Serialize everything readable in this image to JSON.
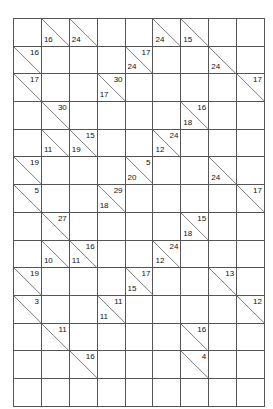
{
  "puzzle": {
    "type": "kakuro-grid",
    "rows": 14,
    "cols": 9,
    "colors": {
      "block": "#8a8a8a",
      "clue": "#e4e4e4",
      "blank": "#ffffff",
      "border": "#555555",
      "text": "#111111"
    },
    "legend": {
      "block": "solid dark grey cell, no clue",
      "clue": "light grey cell split by a diagonal; upper-right number is the across sum, lower-left number is the down sum",
      "blank": "empty white cell to be filled by the solver"
    },
    "cells": [
      [
        {
          "kind": "block"
        },
        {
          "kind": "clue",
          "down": "16"
        },
        {
          "kind": "clue",
          "down": "24"
        },
        {
          "kind": "block"
        },
        {
          "kind": "block"
        },
        {
          "kind": "clue",
          "down": "24"
        },
        {
          "kind": "clue",
          "down": "15"
        },
        {
          "kind": "block"
        },
        {
          "kind": "block"
        }
      ],
      [
        {
          "kind": "clue",
          "across": "16"
        },
        {
          "kind": "blank"
        },
        {
          "kind": "blank"
        },
        {
          "kind": "block"
        },
        {
          "kind": "clue",
          "across": "17",
          "down": "24"
        },
        {
          "kind": "blank"
        },
        {
          "kind": "blank"
        },
        {
          "kind": "clue",
          "down": "24"
        },
        {
          "kind": "block"
        }
      ],
      [
        {
          "kind": "clue",
          "across": "17"
        },
        {
          "kind": "blank"
        },
        {
          "kind": "blank"
        },
        {
          "kind": "clue",
          "across": "30",
          "down": "17"
        },
        {
          "kind": "blank"
        },
        {
          "kind": "blank"
        },
        {
          "kind": "blank"
        },
        {
          "kind": "blank"
        },
        {
          "kind": "clue",
          "across": "17"
        }
      ],
      [
        {
          "kind": "block"
        },
        {
          "kind": "clue",
          "across": "30"
        },
        {
          "kind": "blank"
        },
        {
          "kind": "blank"
        },
        {
          "kind": "blank"
        },
        {
          "kind": "blank"
        },
        {
          "kind": "clue",
          "across": "16",
          "down": "18"
        },
        {
          "kind": "blank"
        },
        {
          "kind": "blank"
        }
      ],
      [
        {
          "kind": "block"
        },
        {
          "kind": "clue",
          "down": "11"
        },
        {
          "kind": "clue",
          "across": "15",
          "down": "19"
        },
        {
          "kind": "blank"
        },
        {
          "kind": "blank"
        },
        {
          "kind": "clue",
          "across": "24",
          "down": "12"
        },
        {
          "kind": "blank"
        },
        {
          "kind": "blank"
        },
        {
          "kind": "blank"
        }
      ],
      [
        {
          "kind": "clue",
          "across": "19"
        },
        {
          "kind": "blank"
        },
        {
          "kind": "blank"
        },
        {
          "kind": "blank"
        },
        {
          "kind": "clue",
          "across": "5",
          "down": "20"
        },
        {
          "kind": "blank"
        },
        {
          "kind": "blank"
        },
        {
          "kind": "clue",
          "down": "24"
        },
        {
          "kind": "block"
        }
      ],
      [
        {
          "kind": "clue",
          "across": "5"
        },
        {
          "kind": "blank"
        },
        {
          "kind": "blank"
        },
        {
          "kind": "clue",
          "across": "29",
          "down": "18"
        },
        {
          "kind": "blank"
        },
        {
          "kind": "blank"
        },
        {
          "kind": "blank"
        },
        {
          "kind": "blank"
        },
        {
          "kind": "clue",
          "across": "17"
        }
      ],
      [
        {
          "kind": "block"
        },
        {
          "kind": "clue",
          "across": "27"
        },
        {
          "kind": "blank"
        },
        {
          "kind": "blank"
        },
        {
          "kind": "blank"
        },
        {
          "kind": "blank"
        },
        {
          "kind": "clue",
          "across": "15",
          "down": "18"
        },
        {
          "kind": "blank"
        },
        {
          "kind": "blank"
        }
      ],
      [
        {
          "kind": "block"
        },
        {
          "kind": "clue",
          "down": "10"
        },
        {
          "kind": "clue",
          "across": "16",
          "down": "11"
        },
        {
          "kind": "blank"
        },
        {
          "kind": "blank"
        },
        {
          "kind": "clue",
          "across": "24",
          "down": "12"
        },
        {
          "kind": "blank"
        },
        {
          "kind": "blank"
        },
        {
          "kind": "blank"
        }
      ],
      [
        {
          "kind": "clue",
          "across": "19"
        },
        {
          "kind": "blank"
        },
        {
          "kind": "blank"
        },
        {
          "kind": "blank"
        },
        {
          "kind": "clue",
          "across": "17",
          "down": "15"
        },
        {
          "kind": "blank"
        },
        {
          "kind": "blank"
        },
        {
          "kind": "clue",
          "across": "13"
        },
        {
          "kind": "block"
        }
      ],
      [
        {
          "kind": "clue",
          "across": "3"
        },
        {
          "kind": "blank"
        },
        {
          "kind": "blank"
        },
        {
          "kind": "clue",
          "across": "11",
          "down": "11"
        },
        {
          "kind": "blank"
        },
        {
          "kind": "blank"
        },
        {
          "kind": "blank"
        },
        {
          "kind": "blank"
        },
        {
          "kind": "clue",
          "across": "12"
        }
      ],
      [
        {
          "kind": "block"
        },
        {
          "kind": "clue",
          "across": "11"
        },
        {
          "kind": "blank"
        },
        {
          "kind": "blank"
        },
        {
          "kind": "blank"
        },
        {
          "kind": "blank"
        },
        {
          "kind": "clue",
          "across": "16"
        },
        {
          "kind": "blank"
        },
        {
          "kind": "blank"
        }
      ],
      [
        {
          "kind": "block"
        },
        {
          "kind": "block"
        },
        {
          "kind": "clue",
          "across": "16"
        },
        {
          "kind": "blank"
        },
        {
          "kind": "blank"
        },
        {
          "kind": "block"
        },
        {
          "kind": "clue",
          "across": "4"
        },
        {
          "kind": "blank"
        },
        {
          "kind": "blank"
        }
      ],
      [
        {
          "kind": "blank"
        },
        {
          "kind": "blank"
        },
        {
          "kind": "blank"
        },
        {
          "kind": "blank"
        },
        {
          "kind": "blank"
        },
        {
          "kind": "blank"
        },
        {
          "kind": "blank"
        },
        {
          "kind": "blank"
        },
        {
          "kind": "blank"
        }
      ]
    ]
  }
}
